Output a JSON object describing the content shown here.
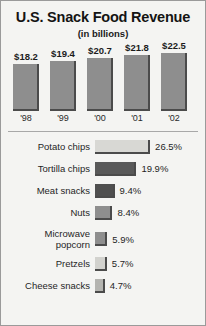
{
  "chart_data": [
    {
      "type": "bar",
      "orientation": "vertical",
      "title": "U.S. Snack Food Revenue",
      "subtitle": "(in billions)",
      "xlabel": "",
      "ylabel": "",
      "grid": false,
      "legend": "none",
      "ylim": [
        0,
        24
      ],
      "categories": [
        "'98",
        "'99",
        "'00",
        "'01",
        "'02"
      ],
      "values": [
        18.2,
        19.4,
        20.7,
        21.8,
        22.5
      ],
      "value_labels": [
        "$18.2",
        "$19.4",
        "$20.7",
        "$21.8",
        "$22.5"
      ],
      "bar_color": "#8e8e8e",
      "bar_shadow_color": "#4b4b4b"
    },
    {
      "type": "bar",
      "orientation": "horizontal",
      "title": "",
      "xlabel": "",
      "ylabel": "",
      "grid": false,
      "legend": "none",
      "xlim": [
        0,
        30
      ],
      "categories": [
        "Potato chips",
        "Tortilla chips",
        "Meat snacks",
        "Nuts",
        "Microwave popcorn",
        "Pretzels",
        "Cheese snacks"
      ],
      "values": [
        26.5,
        19.9,
        9.4,
        8.4,
        5.9,
        5.7,
        4.7
      ],
      "value_labels": [
        "26.5%",
        "19.9%",
        "9.4%",
        "8.4%",
        "5.9%",
        "5.7%",
        "4.7%"
      ],
      "bar_colors": [
        "#d8d8d4",
        "#595959",
        "#4f4f4f",
        "#8e8e8e",
        "#8e8e8e",
        "#d2d2ce",
        "#b4b4b0"
      ]
    }
  ],
  "header": {
    "title": "U.S. Snack Food Revenue",
    "subtitle": "(in billions)"
  },
  "column_chart": {
    "bars": [
      {
        "label": "'98",
        "value_label": "$18.2",
        "value": 18.2
      },
      {
        "label": "'99",
        "value_label": "$19.4",
        "value": 19.4
      },
      {
        "label": "'00",
        "value_label": "$20.7",
        "value": 20.7
      },
      {
        "label": "'01",
        "value_label": "$21.8",
        "value": 21.8
      },
      {
        "label": "'02",
        "value_label": "$22.5",
        "value": 22.5
      }
    ]
  },
  "bar_list": {
    "rows": [
      {
        "label": "Potato chips",
        "label_line2": "",
        "value_label": "26.5%",
        "value": 26.5,
        "color": "#d8d8d4"
      },
      {
        "label": "Tortilla chips",
        "label_line2": "",
        "value_label": "19.9%",
        "value": 19.9,
        "color": "#595959"
      },
      {
        "label": "Meat snacks",
        "label_line2": "",
        "value_label": "9.4%",
        "value": 9.4,
        "color": "#4f4f4f"
      },
      {
        "label": "Nuts",
        "label_line2": "",
        "value_label": "8.4%",
        "value": 8.4,
        "color": "#8e8e8e"
      },
      {
        "label": "Microwave",
        "label_line2": "popcorn",
        "value_label": "5.9%",
        "value": 5.9,
        "color": "#8e8e8e"
      },
      {
        "label": "Pretzels",
        "label_line2": "",
        "value_label": "5.7%",
        "value": 5.7,
        "color": "#d2d2ce"
      },
      {
        "label": "Cheese snacks",
        "label_line2": "",
        "value_label": "4.7%",
        "value": 4.7,
        "color": "#b4b4b0"
      }
    ]
  }
}
